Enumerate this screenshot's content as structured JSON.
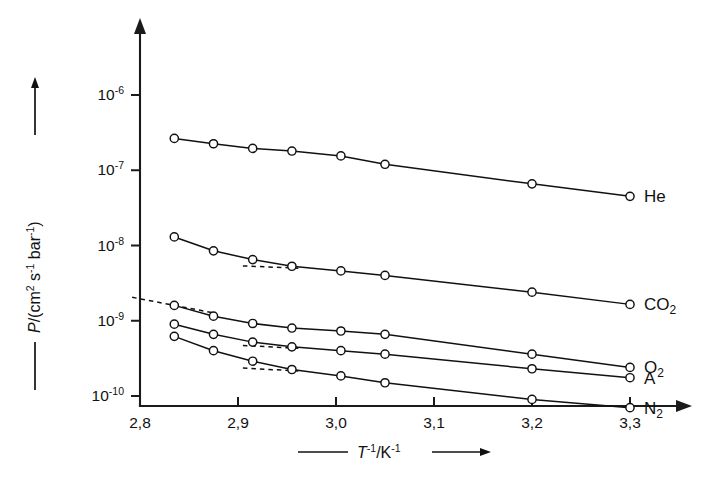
{
  "chart_data": {
    "type": "line",
    "title": "",
    "subtitle": "",
    "xlabel": "T⁻¹/K⁻¹",
    "ylabel": "P/(cm² s⁻¹ bar⁻¹)",
    "xlabel_prefix_arrow": "——",
    "xlabel_suffix_arrow": "——▶",
    "yscale": "log",
    "xscale": "linear",
    "xlim": [
      2.78,
      3.33
    ],
    "ylim": [
      3e-11,
      2e-06
    ],
    "grid": false,
    "legend_position": "right-inline",
    "xticks": [
      2.8,
      2.9,
      3.0,
      3.1,
      3.2,
      3.3
    ],
    "xticklabels": [
      "2,8",
      "2,9",
      "3,0",
      "3,1",
      "3,2",
      "3,3"
    ],
    "yticks": [
      1e-06,
      1e-07,
      1e-08,
      1e-09,
      1e-10
    ],
    "yticklabels": [
      "10⁻⁶",
      "10⁻⁷",
      "10⁻⁸",
      "10⁻⁹",
      "10⁻¹⁰"
    ],
    "ytick_mantissa": "10",
    "ytick_exponents": [
      "-6",
      "-7",
      "-8",
      "-9",
      "-10"
    ],
    "marker": "open-circle",
    "series": [
      {
        "name": "He",
        "label": "He",
        "x": [
          2.835,
          2.875,
          2.915,
          2.955,
          3.005,
          3.05,
          3.2,
          3.3
        ],
        "y": [
          2.65e-07,
          2.25e-07,
          1.95e-07,
          1.8e-07,
          1.55e-07,
          1.2e-07,
          6.6e-08,
          4.5e-08
        ],
        "dashed_segment": null
      },
      {
        "name": "CO2",
        "label": "CO₂",
        "x": [
          2.835,
          2.875,
          2.915,
          2.955,
          3.005,
          3.05,
          3.2,
          3.3
        ],
        "y": [
          1.3e-08,
          8.5e-09,
          6.5e-09,
          5.3e-09,
          4.6e-09,
          4e-09,
          2.4e-09,
          1.65e-09
        ],
        "dashed_segment": {
          "x": [
            2.905,
            2.962
          ],
          "y": [
            5.35e-09,
            5e-09
          ]
        }
      },
      {
        "name": "O2",
        "label": "O₂",
        "x": [
          2.835,
          2.875,
          2.915,
          2.955,
          3.005,
          3.05,
          3.2,
          3.3
        ],
        "y": [
          1.6e-09,
          1.15e-09,
          9.2e-10,
          8e-10,
          7.3e-10,
          6.6e-10,
          3.6e-10,
          2.4e-10
        ],
        "dashed_segment": {
          "x": [
            2.792,
            2.878
          ],
          "y": [
            2.05e-09,
            1.25e-09
          ]
        }
      },
      {
        "name": "A",
        "label": "A",
        "x": [
          2.835,
          2.875,
          2.915,
          2.955,
          3.005,
          3.05,
          3.2,
          3.3
        ],
        "y": [
          9e-10,
          6.6e-10,
          5.2e-10,
          4.5e-10,
          4e-10,
          3.6e-10,
          2.3e-10,
          1.75e-10
        ],
        "dashed_segment": {
          "x": [
            2.905,
            2.962
          ],
          "y": [
            4.7e-10,
            4.3e-10
          ]
        }
      },
      {
        "name": "N2",
        "label": "N₂",
        "x": [
          2.835,
          2.875,
          2.915,
          2.955,
          3.005,
          3.05,
          3.2,
          3.3
        ],
        "y": [
          6.2e-10,
          4e-10,
          2.9e-10,
          2.25e-10,
          1.85e-10,
          1.5e-10,
          9e-11,
          7e-11
        ],
        "dashed_segment": {
          "x": [
            2.905,
            2.962
          ],
          "y": [
            2.35e-10,
            2.15e-10
          ]
        }
      }
    ]
  },
  "axis_titles": {
    "x_full": "—— T⁻¹/K⁻¹ ——▶",
    "y_full": "—— P/(cm² s⁻¹ bar⁻¹) ——▶",
    "x_var": "T",
    "x_var_sup": "-1",
    "x_unit": "K",
    "x_unit_sup": "-1",
    "x_slash": "/",
    "y_var": "P",
    "y_open": "/(cm",
    "y_cm_sup": "2",
    "y_s": "s",
    "y_s_sup": "-1",
    "y_bar": "bar",
    "y_bar_sup": "-1",
    "y_close": ")"
  },
  "colors": {
    "ink": "#111111",
    "axis": "#1a1a1a",
    "background": "#ffffff",
    "marker_fill": "#ffffff"
  }
}
